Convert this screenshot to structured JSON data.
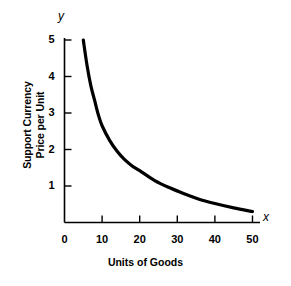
{
  "chart_data": {
    "type": "line",
    "title": "",
    "xlabel": "Units of Goods",
    "ylabel_line1": "Support Currency",
    "ylabel_line2": "Price per Unit",
    "x_axis_letter": "x",
    "y_axis_letter": "y",
    "xlim": [
      0,
      52
    ],
    "ylim": [
      0,
      5
    ],
    "grid": false,
    "legend": null,
    "xticks": [
      "0",
      "10",
      "20",
      "30",
      "40",
      "50"
    ],
    "xtick_values": [
      0,
      10,
      20,
      30,
      40,
      50
    ],
    "yticks": [
      "1",
      "2",
      "3",
      "4",
      "5"
    ],
    "ytick_values": [
      1,
      2,
      3,
      4,
      5
    ],
    "series": [
      {
        "name": "Demand curve",
        "color": "#000000",
        "x": [
          5,
          6,
          7,
          8,
          9,
          10,
          12,
          14,
          16,
          18,
          20,
          24,
          28,
          32,
          36,
          40,
          45,
          50
        ],
        "y": [
          5.0,
          4.3,
          3.75,
          3.35,
          2.95,
          2.65,
          2.25,
          1.95,
          1.72,
          1.55,
          1.42,
          1.15,
          0.95,
          0.78,
          0.63,
          0.52,
          0.4,
          0.3
        ]
      }
    ]
  }
}
